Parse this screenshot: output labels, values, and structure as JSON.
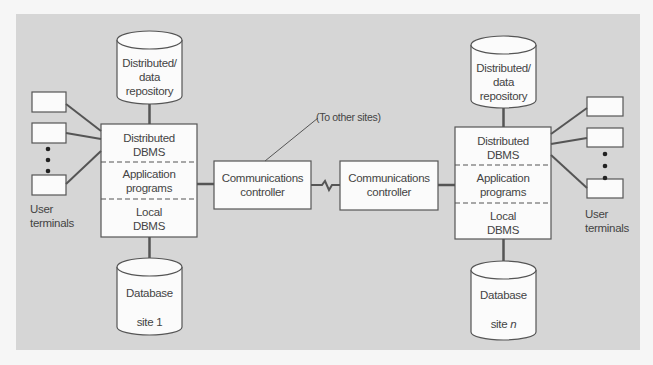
{
  "diagram": {
    "colors": {
      "background": "#d6d6d6",
      "box_fill": "#fbfbfb",
      "stroke": "#555555",
      "text": "#444444"
    },
    "annotation": "(To other sites)",
    "sites": [
      {
        "id": "site-1",
        "repository": {
          "line1": "Distributed/",
          "line2": "data",
          "line3": "repository"
        },
        "stack": [
          {
            "line1": "Distributed",
            "line2": "DBMS"
          },
          {
            "line1": "Application",
            "line2": "programs"
          },
          {
            "line1": "Local",
            "line2": "DBMS"
          }
        ],
        "database": {
          "line1": "Database",
          "line2_prefix": "site ",
          "line2_suffix": "1"
        },
        "terminals_label": {
          "line1": "User",
          "line2": "terminals"
        },
        "controller": {
          "line1": "Communications",
          "line2": "controller"
        }
      },
      {
        "id": "site-n",
        "repository": {
          "line1": "Distributed/",
          "line2": "data",
          "line3": "repository"
        },
        "stack": [
          {
            "line1": "Distributed",
            "line2": "DBMS"
          },
          {
            "line1": "Application",
            "line2": "programs"
          },
          {
            "line1": "Local",
            "line2": "DBMS"
          }
        ],
        "database": {
          "line1": "Database",
          "line2_prefix": "site ",
          "line2_suffix": "n"
        },
        "terminals_label": {
          "line1": "User",
          "line2": "terminals"
        },
        "controller": {
          "line1": "Communications",
          "line2": "controller"
        }
      }
    ]
  }
}
